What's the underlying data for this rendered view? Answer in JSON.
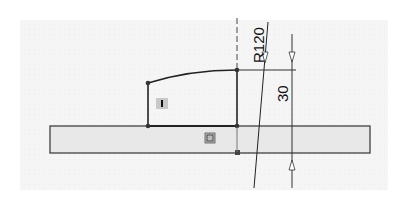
{
  "drawing": {
    "type": "cad-sketch",
    "dimensions": [
      {
        "id": "radius",
        "label": "R120",
        "kind": "radius"
      },
      {
        "id": "height",
        "label": "30",
        "kind": "linear-vertical"
      }
    ],
    "relations": [
      {
        "id": "vertical-relation",
        "glyph": "I",
        "meaning": "vertical"
      },
      {
        "id": "fix-relation",
        "glyph": "⊡",
        "meaning": "fixed/coincident"
      }
    ],
    "colors": {
      "line": "#1a1a1a",
      "base_fill": "#e8e8e8",
      "background": "#f5f5f5",
      "relation_badge": "#c8c8c8"
    }
  }
}
